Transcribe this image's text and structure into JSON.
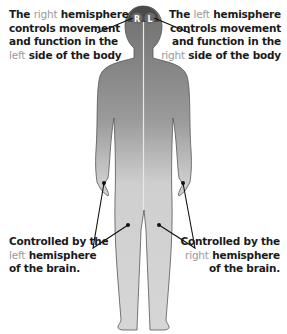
{
  "top_left": {
    "line1_pre": "The ",
    "line1_hl": "right",
    "line1_post": " hemisphere",
    "line2": "controls movement",
    "line3": "and function in the",
    "line4_hl": "left",
    "line4_post": " side of the body"
  },
  "top_right": {
    "line1_pre": "The ",
    "line1_hl": "left",
    "line1_post": " hemisphere",
    "line2": "controls movement",
    "line3": "and function in the",
    "line4_hl": "right",
    "line4_post": " side of the body"
  },
  "bottom_left": {
    "line1": "Controlled by the",
    "line2_hl": "left",
    "line2_post": " hemisphere",
    "line3": "of the brain."
  },
  "bottom_right": {
    "line1": "Controlled by the",
    "line2_hl": "right",
    "line2_post": " hemisphere",
    "line3": "of the brain."
  },
  "head_labels": {
    "right": "R",
    "left": "L"
  },
  "colors": {
    "body_light": "#d4d4d4",
    "body_dark": "#8a8a8a",
    "highlight_text": "#9a9a9a",
    "text": "#1a1a1a"
  }
}
